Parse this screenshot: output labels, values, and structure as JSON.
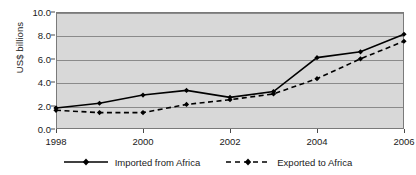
{
  "chart_data": {
    "type": "line",
    "title": "",
    "xlabel": "",
    "ylabel": "US$ billions",
    "ylim": [
      0.0,
      10.0
    ],
    "xlim": [
      1998,
      2006
    ],
    "grid": true,
    "legend_position": "bottom",
    "x": [
      1998,
      1999,
      2000,
      2001,
      2002,
      2003,
      2004,
      2005,
      2006
    ],
    "x_tick_labels": [
      "1998",
      "2000",
      "2002",
      "2004",
      "2006"
    ],
    "x_tick_values": [
      1998,
      2000,
      2002,
      2004,
      2006
    ],
    "y_tick_labels": [
      "0.0",
      "2.0",
      "4.0",
      "6.0",
      "8.0",
      "10.0"
    ],
    "y_tick_values": [
      0.0,
      2.0,
      4.0,
      6.0,
      8.0,
      10.0
    ],
    "series": [
      {
        "name": "Imported from Africa",
        "style": "solid",
        "marker": "diamond",
        "color": "#000000",
        "values": [
          1.8,
          2.2,
          2.9,
          3.3,
          2.7,
          3.2,
          6.1,
          6.6,
          8.1
        ]
      },
      {
        "name": "Exported to Africa",
        "style": "dashed",
        "marker": "diamond",
        "color": "#000000",
        "values": [
          1.6,
          1.4,
          1.4,
          2.1,
          2.5,
          3.0,
          4.3,
          6.0,
          7.5
        ]
      }
    ]
  },
  "legend": {
    "entries": [
      {
        "label": "Imported from Africa"
      },
      {
        "label": "Exported to Africa"
      }
    ]
  },
  "colors": {
    "plot_background": "#d8d8d8",
    "gridline": "#8a8a8a",
    "axis": "#7a7a7a",
    "series": "#000000",
    "text": "#1a1a1a"
  }
}
